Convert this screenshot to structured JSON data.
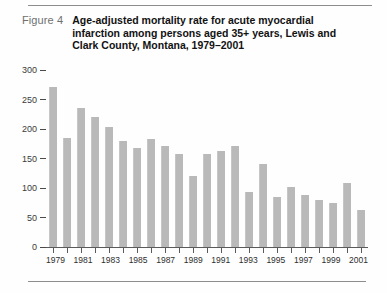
{
  "figure": {
    "label": "Figure 4",
    "title": "Age-adjusted mortality rate for acute myocardial infarction among persons aged 35+ years, Lewis and Clark County, Montana, 1979–2001"
  },
  "chart_data": {
    "type": "bar",
    "title": "Age-adjusted mortality rate for acute myocardial infarction among persons aged 35+ years, Lewis and Clark County, Montana, 1979–2001",
    "xlabel": "",
    "ylabel": "",
    "categories": [
      "1979",
      "1980",
      "1981",
      "1982",
      "1983",
      "1984",
      "1985",
      "1986",
      "1987",
      "1988",
      "1989",
      "1990",
      "1991",
      "1992",
      "1993",
      "1994",
      "1995",
      "1996",
      "1997",
      "1998",
      "1999",
      "2000",
      "2001"
    ],
    "values": [
      272,
      184,
      235,
      220,
      204,
      180,
      168,
      183,
      172,
      158,
      120,
      158,
      163,
      172,
      94,
      140,
      84,
      102,
      89,
      79,
      74,
      108,
      63
    ],
    "ylim": [
      0,
      300
    ],
    "yticks": [
      0,
      50,
      100,
      150,
      200,
      250,
      300
    ],
    "ytick_labels": [
      "0",
      "50",
      "100",
      "150",
      "200",
      "250",
      "300"
    ],
    "xtick_labels_shown": [
      "1979",
      "1981",
      "1983",
      "1985",
      "1987",
      "1989",
      "1991",
      "1993",
      "1995",
      "1997",
      "1999",
      "2001"
    ],
    "grid": false,
    "legend": "none",
    "bar_color": "#b9b9b9",
    "axis_color": "#5a5a5a"
  }
}
